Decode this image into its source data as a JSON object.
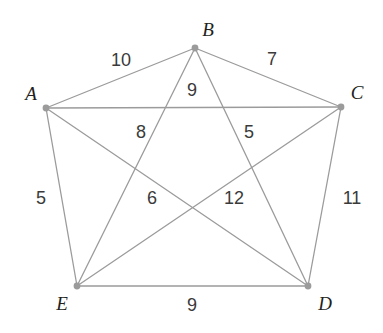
{
  "figure": {
    "type": "weighted-graph",
    "background_color": "#ffffff",
    "edge_color": "#9b9b9b",
    "vertex_color": "#9b9b9b",
    "vertex_label_color": "#231f20",
    "edge_label_color": "#3a3a3a",
    "width": 383,
    "height": 333
  },
  "vertices": [
    {
      "id": "A",
      "label": "A",
      "x": 46,
      "y": 108,
      "label_x": 31,
      "label_y": 93
    },
    {
      "id": "B",
      "label": "B",
      "x": 195,
      "y": 48,
      "label_x": 208,
      "label_y": 29
    },
    {
      "id": "C",
      "label": "C",
      "x": 341,
      "y": 107,
      "label_x": 357,
      "label_y": 92
    },
    {
      "id": "D",
      "label": "D",
      "x": 308,
      "y": 286,
      "label_x": 325,
      "label_y": 303
    },
    {
      "id": "E",
      "label": "E",
      "x": 77,
      "y": 286,
      "label_x": 62,
      "label_y": 303
    }
  ],
  "edges": [
    {
      "id": "AB",
      "from": "A",
      "to": "B",
      "weight": "10",
      "label_x": 121,
      "label_y": 60
    },
    {
      "id": "BC",
      "from": "B",
      "to": "C",
      "weight": "7",
      "label_x": 272,
      "label_y": 59
    },
    {
      "id": "CD",
      "from": "C",
      "to": "D",
      "weight": "11",
      "label_x": 352,
      "label_y": 198
    },
    {
      "id": "DE",
      "from": "D",
      "to": "E",
      "weight": "9",
      "label_x": 192,
      "label_y": 305
    },
    {
      "id": "EA",
      "from": "E",
      "to": "A",
      "weight": "5",
      "label_x": 41,
      "label_y": 198
    },
    {
      "id": "BE",
      "from": "B",
      "to": "E",
      "weight": "8",
      "label_x": 141,
      "label_y": 132
    },
    {
      "id": "BD",
      "from": "B",
      "to": "D",
      "weight": "5",
      "label_x": 249,
      "label_y": 132
    },
    {
      "id": "AC",
      "from": "A",
      "to": "C",
      "weight": "9",
      "label_x": 192,
      "label_y": 90
    },
    {
      "id": "AD",
      "from": "A",
      "to": "D",
      "weight": "6",
      "label_x": 152,
      "label_y": 198
    },
    {
      "id": "CE",
      "from": "C",
      "to": "E",
      "weight": "12",
      "label_x": 234,
      "label_y": 198
    }
  ]
}
